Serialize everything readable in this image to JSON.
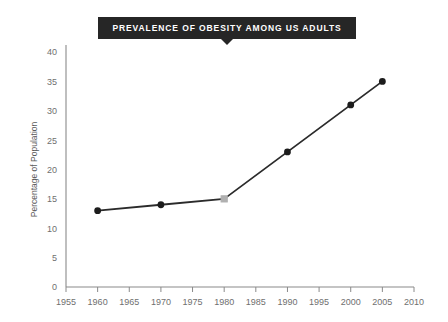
{
  "title_banner": {
    "text": "PREVALENCE OF OBESITY AMONG US ADULTS",
    "background_color": "#262626",
    "text_color": "#ffffff"
  },
  "chart_data": {
    "type": "line",
    "title": "PREVALENCE OF OBESITY AMONG US ADULTS",
    "xlabel": "",
    "ylabel": "Percentage of Population",
    "x": [
      1960,
      1970,
      1980,
      1990,
      2000,
      2005
    ],
    "values": [
      13,
      14,
      15,
      23,
      31,
      35
    ],
    "series": [
      {
        "name": "Percentage of Population",
        "x": [
          1960,
          1970,
          1980,
          1990,
          2000,
          2005
        ],
        "values": [
          13,
          14,
          15,
          23,
          31,
          35
        ]
      }
    ],
    "points": [
      {
        "x": 1960,
        "y": 13,
        "marker": "circle",
        "color": "#1c1c1c"
      },
      {
        "x": 1970,
        "y": 14,
        "marker": "circle",
        "color": "#1c1c1c"
      },
      {
        "x": 1980,
        "y": 15,
        "marker": "square",
        "color": "#b0b0b0"
      },
      {
        "x": 1990,
        "y": 23,
        "marker": "circle",
        "color": "#1c1c1c"
      },
      {
        "x": 2000,
        "y": 31,
        "marker": "circle",
        "color": "#1c1c1c"
      },
      {
        "x": 2005,
        "y": 35,
        "marker": "circle",
        "color": "#1c1c1c"
      }
    ],
    "xlim": [
      1955,
      2010
    ],
    "ylim": [
      0,
      40
    ],
    "xticks": [
      1955,
      1960,
      1965,
      1970,
      1975,
      1980,
      1985,
      1990,
      1995,
      2000,
      2005,
      2010
    ],
    "yticks": [
      0,
      5,
      10,
      15,
      20,
      25,
      30,
      35,
      40
    ],
    "xtick_labels": [
      "1955",
      "1960",
      "1965",
      "1970",
      "1975",
      "1980",
      "1985",
      "1990",
      "1995",
      "2000",
      "2005",
      "2010"
    ],
    "ytick_labels": [
      "0",
      "5",
      "10",
      "15",
      "20",
      "25",
      "30",
      "35",
      "40"
    ],
    "grid": false,
    "legend": null,
    "line_color": "#2b2b2b",
    "background_color": "#ffffff"
  }
}
